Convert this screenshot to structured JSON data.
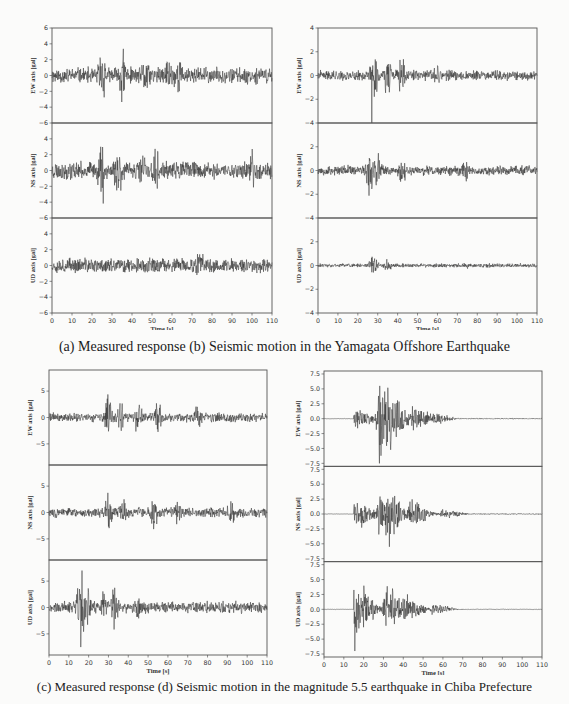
{
  "captions": {
    "top": "(a) Measured response (b) Seismic motion in the Yamagata Offshore Earthquake",
    "bottom": "(c) Measured response (d) Seismic motion in the magnitude 5.5 earthquake in Chiba Prefecture"
  },
  "chart_data": [
    {
      "id": "a",
      "type": "line",
      "title": "(a) Measured response — Yamagata Offshore Earthquake",
      "xlabel": "Time [s]",
      "xlim": [
        0,
        110
      ],
      "xticks": [
        0,
        10,
        20,
        30,
        40,
        50,
        60,
        70,
        80,
        90,
        100,
        110
      ],
      "grid": false,
      "box": {
        "left": 52,
        "top": 28,
        "right": 272,
        "bottom": 313
      },
      "subplots": [
        {
          "ylabel": "EW axis [gal]",
          "ylim": [
            -6,
            6
          ],
          "yticks": [
            -6,
            -4,
            -2,
            0,
            2,
            4,
            6
          ],
          "envelope": {
            "base": 1.2,
            "peaks": [
              [
                25,
                4.3
              ],
              [
                35,
                5.0
              ],
              [
                47,
                3.5
              ],
              [
                58,
                3.4
              ],
              [
                63,
                3.6
              ]
            ]
          },
          "seed": 11
        },
        {
          "ylabel": "NS axis [gal]",
          "ylim": [
            -6,
            6
          ],
          "yticks": [
            -6,
            -4,
            -2,
            0,
            2,
            4
          ],
          "envelope": {
            "base": 1.3,
            "peaks": [
              [
                25,
                4.8
              ],
              [
                33,
                5.0
              ],
              [
                45,
                3.6
              ],
              [
                52,
                3.6
              ],
              [
                100,
                3.0
              ]
            ]
          },
          "seed": 23
        },
        {
          "ylabel": "UD axis [gal]",
          "ylim": [
            -6,
            6
          ],
          "yticks": [
            -6,
            -4,
            -2,
            0,
            2,
            4
          ],
          "envelope": {
            "base": 1.1,
            "peaks": [
              [
                74,
                2.5
              ]
            ]
          },
          "seed": 37
        }
      ]
    },
    {
      "id": "b",
      "type": "line",
      "title": "(b) Seismic motion — Yamagata Offshore Earthquake",
      "xlabel": "Time [s]",
      "xlim": [
        0,
        110
      ],
      "xticks": [
        0,
        10,
        20,
        30,
        40,
        50,
        60,
        70,
        80,
        90,
        100,
        110
      ],
      "grid": false,
      "box": {
        "left": 318,
        "top": 28,
        "right": 537,
        "bottom": 313
      },
      "subplots": [
        {
          "ylabel": "EW axis [gal]",
          "ylim": [
            -4,
            4
          ],
          "yticks": [
            -4,
            -2,
            0,
            2,
            4
          ],
          "envelope": {
            "base": 0.5,
            "peaks": [
              [
                28,
                2.4
              ],
              [
                35,
                2.2
              ],
              [
                42,
                1.8
              ],
              [
                60,
                1.2
              ]
            ]
          },
          "spike": {
            "t": 27,
            "v": -4.0
          },
          "seed": 41
        },
        {
          "ylabel": "NS axis [gal]",
          "ylim": [
            -4,
            4
          ],
          "yticks": [
            -4,
            -2,
            0,
            2
          ],
          "envelope": {
            "base": 0.5,
            "peaks": [
              [
                26,
                2.4
              ],
              [
                30,
                2.0
              ],
              [
                42,
                1.6
              ],
              [
                74,
                1.4
              ]
            ]
          },
          "seed": 53
        },
        {
          "ylabel": "UD axis [gal]",
          "ylim": [
            -4,
            4
          ],
          "yticks": [
            -4,
            -2,
            0,
            2
          ],
          "envelope": {
            "base": 0.2,
            "peaks": [
              [
                28,
                1.1
              ],
              [
                35,
                0.6
              ],
              [
                74,
                0.4
              ]
            ]
          },
          "seed": 61
        }
      ]
    },
    {
      "id": "c",
      "type": "line",
      "title": "(c) Measured response — M5.5 earthquake in Chiba Prefecture",
      "xlabel": "Time [s]",
      "xlim": [
        0,
        110
      ],
      "xticks": [
        0,
        10,
        20,
        30,
        40,
        50,
        60,
        70,
        80,
        90,
        100,
        110
      ],
      "grid": false,
      "box": {
        "left": 49,
        "top": 370,
        "right": 267,
        "bottom": 655
      },
      "subplots": [
        {
          "ylabel": "EW axis [gal]",
          "ylim": [
            -9,
            9
          ],
          "yticks": [
            -5,
            0,
            5
          ],
          "envelope": {
            "base": 1.1,
            "peaks": [
              [
                30,
                4.8
              ],
              [
                36,
                3.5
              ],
              [
                45,
                4.5
              ],
              [
                55,
                3.5
              ],
              [
                75,
                3.0
              ]
            ]
          },
          "seed": 71
        },
        {
          "ylabel": "NS axis [gal]",
          "ylim": [
            -9,
            9
          ],
          "yticks": [
            -5,
            0,
            5
          ],
          "envelope": {
            "base": 1.1,
            "peaks": [
              [
                30,
                4.5
              ],
              [
                37,
                3.8
              ],
              [
                53,
                4.3
              ],
              [
                65,
                3.0
              ],
              [
                92,
                3.0
              ]
            ]
          },
          "seed": 83
        },
        {
          "ylabel": "UD axis [gal]",
          "ylim": [
            -9,
            9
          ],
          "yticks": [
            -5,
            0,
            5
          ],
          "envelope": {
            "base": 1.3,
            "peaks": [
              [
                16,
                8.5
              ],
              [
                20,
                4.0
              ],
              [
                28,
                4.0
              ],
              [
                33,
                4.7
              ],
              [
                45,
                2.5
              ]
            ]
          },
          "spike": {
            "t": 16,
            "v": -7.5
          },
          "seed": 97
        }
      ]
    },
    {
      "id": "d",
      "type": "line",
      "title": "(d) Seismic motion — M5.5 earthquake in Chiba Prefecture",
      "xlabel": "Time [s]",
      "xlim": [
        0,
        110
      ],
      "xticks": [
        0,
        10,
        20,
        30,
        40,
        50,
        60,
        70,
        80,
        90,
        100,
        110
      ],
      "grid": false,
      "box": {
        "left": 324,
        "top": 371,
        "right": 542,
        "bottom": 657
      },
      "subplots": [
        {
          "ylabel": "EW axis [gal]",
          "ylim": [
            -8,
            8
          ],
          "yticks": [
            -7.5,
            -5.0,
            -2.5,
            0.0,
            2.5,
            5.0,
            7.5
          ],
          "onset": 15,
          "envelope": {
            "base": 0.1,
            "peaks": [
              [
                16,
                2.2
              ],
              [
                28,
                7.5
              ],
              [
                32,
                6.5
              ],
              [
                45,
                2.5
              ],
              [
                55,
                1.2
              ]
            ]
          },
          "spike": {
            "t": 28,
            "v": -7.5
          },
          "seed": 101
        },
        {
          "ylabel": "NS axis [gal]",
          "ylim": [
            -8,
            8
          ],
          "yticks": [
            -7.5,
            -5.0,
            -2.5,
            0.0,
            2.5,
            5.0,
            7.5
          ],
          "onset": 15,
          "envelope": {
            "base": 0.1,
            "peaks": [
              [
                16,
                3.0
              ],
              [
                28,
                4.5
              ],
              [
                34,
                4.0
              ],
              [
                43,
                3.0
              ],
              [
                60,
                1.0
              ]
            ]
          },
          "spike": {
            "t": 33,
            "v": -5.5
          },
          "seed": 113
        },
        {
          "ylabel": "UD axis [gal]",
          "ylim": [
            -8,
            8
          ],
          "yticks": [
            -7.5,
            -5.0,
            -2.5,
            0.0,
            2.5,
            5.0,
            7.5
          ],
          "onset": 15,
          "envelope": {
            "base": 0.05,
            "peaks": [
              [
                15.5,
                6.0
              ],
              [
                31,
                4.8
              ],
              [
                40,
                3.0
              ],
              [
                55,
                1.2
              ]
            ]
          },
          "spike": {
            "t": 15.5,
            "v": -7.0
          },
          "seed": 127
        }
      ]
    }
  ]
}
